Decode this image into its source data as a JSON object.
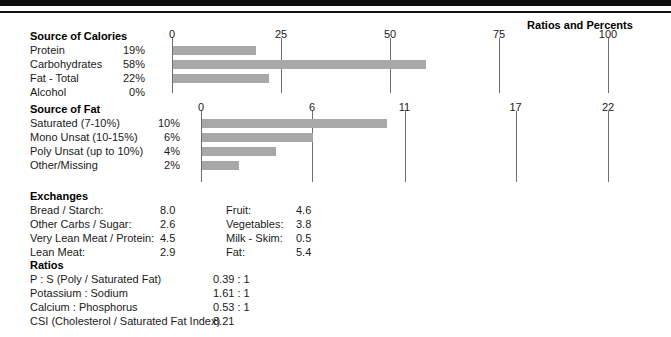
{
  "header": {
    "panel_title": "Ratios and Percents"
  },
  "calories": {
    "title": "Source of Calories",
    "axis": {
      "ticks": [
        0,
        25,
        50,
        75,
        100
      ],
      "min": 0,
      "max": 100
    },
    "rows": [
      {
        "label": "Protein",
        "value": "19%",
        "pct": 19
      },
      {
        "label": "Carbohydrates",
        "value": "58%",
        "pct": 58
      },
      {
        "label": "Fat - Total",
        "value": "22%",
        "pct": 22
      },
      {
        "label": "Alcohol",
        "value": "0%",
        "pct": 0
      }
    ]
  },
  "fat": {
    "title": "Source of Fat",
    "axis": {
      "ticks": [
        0,
        6,
        11,
        17,
        22
      ],
      "min": 0,
      "max": 22
    },
    "rows": [
      {
        "label": "Saturated (7-10%)",
        "value": "10%",
        "pct": 10
      },
      {
        "label": "Mono Unsat (10-15%)",
        "value": "6%",
        "pct": 6
      },
      {
        "label": "Poly Unsat (up to 10%)",
        "value": "4%",
        "pct": 4
      },
      {
        "label": "Other/Missing",
        "value": "2%",
        "pct": 2
      }
    ]
  },
  "exchanges": {
    "title": "Exchanges",
    "left": [
      {
        "label": "Bread / Starch:",
        "value": "8.0"
      },
      {
        "label": "Other Carbs / Sugar:",
        "value": "2.6"
      },
      {
        "label": "Very Lean Meat / Protein:",
        "value": "4.5"
      },
      {
        "label": "Lean Meat:",
        "value": "2.9"
      }
    ],
    "right": [
      {
        "label": "Fruit:",
        "value": "4.6"
      },
      {
        "label": "Vegetables:",
        "value": "3.8"
      },
      {
        "label": "Milk - Skim:",
        "value": "0.5"
      },
      {
        "label": "Fat:",
        "value": "5.4"
      }
    ]
  },
  "ratios": {
    "title": "Ratios",
    "rows": [
      {
        "label": "P : S (Poly / Saturated Fat)",
        "value": "0.39 : 1"
      },
      {
        "label": "Potassium : Sodium",
        "value": "1.61 : 1"
      },
      {
        "label": "Calcium : Phosphorus",
        "value": "0.53 : 1"
      },
      {
        "label": "CSI (Cholesterol / Saturated Fat Index)",
        "value": "8.21"
      }
    ]
  },
  "chart_data": [
    {
      "type": "bar",
      "title": "Source of Calories",
      "orientation": "horizontal",
      "categories": [
        "Protein",
        "Carbohydrates",
        "Fat - Total",
        "Alcohol"
      ],
      "values": [
        19,
        58,
        22,
        0
      ],
      "data_labels": [
        "19%",
        "58%",
        "22%",
        "0%"
      ],
      "xlabel": "",
      "ylabel": "",
      "xlim": [
        0,
        100
      ],
      "xticks": [
        0,
        25,
        50,
        75,
        100
      ],
      "grid": false,
      "legend": "none",
      "bar_color": "#a8a8a8"
    },
    {
      "type": "bar",
      "title": "Source of Fat",
      "orientation": "horizontal",
      "categories": [
        "Saturated (7-10%)",
        "Mono Unsat (10-15%)",
        "Poly Unsat (up to 10%)",
        "Other/Missing"
      ],
      "values": [
        10,
        6,
        4,
        2
      ],
      "data_labels": [
        "10%",
        "6%",
        "4%",
        "2%"
      ],
      "xlabel": "",
      "ylabel": "",
      "xlim": [
        0,
        22
      ],
      "xticks": [
        0,
        6,
        11,
        17,
        22
      ],
      "grid": false,
      "legend": "none",
      "bar_color": "#a8a8a8"
    }
  ]
}
